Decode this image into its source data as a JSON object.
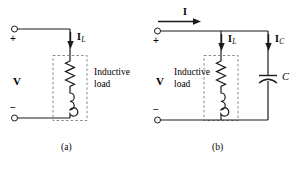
{
  "figure": {
    "background_color": "#ffffff",
    "line_color": "#1a1a1a",
    "dashed_box_color": "#7a7a7a"
  },
  "circuit_a": {
    "caption": "(a)",
    "voltage_label": "V",
    "plus_sign": "+",
    "minus_sign": "−",
    "branch_current": {
      "symbol": "I",
      "subscript": "L"
    },
    "load_text_line1": "Inductive",
    "load_text_line2": "load",
    "components": {
      "resistor": "resistor-zigzag",
      "inductor": "inductor-coil"
    }
  },
  "circuit_b": {
    "caption": "(b)",
    "voltage_label": "V",
    "plus_sign": "+",
    "minus_sign": "−",
    "source_current": {
      "symbol": "I",
      "subscript": ""
    },
    "inductor_current": {
      "symbol": "I",
      "subscript": "L"
    },
    "capacitor_current": {
      "symbol": "I",
      "subscript": "C"
    },
    "capacitor_label": "C",
    "load_text_line1": "Inductive",
    "load_text_line2": "load",
    "components": {
      "resistor": "resistor-zigzag",
      "inductor": "inductor-coil",
      "capacitor": "capacitor-polarized"
    }
  }
}
